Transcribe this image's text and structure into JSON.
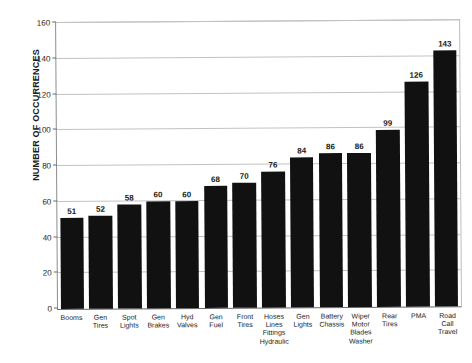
{
  "chart_data": {
    "type": "bar",
    "title": "",
    "xlabel": "",
    "ylabel": "NUMBER OF OCCURRENCES",
    "ylim": [
      0,
      160
    ],
    "ytick_step": 20,
    "yticks": [
      "0",
      "20",
      "40",
      "60",
      "80",
      "100",
      "120",
      "140",
      "160"
    ],
    "grid": true,
    "legend": "none",
    "bar_color": "#111111",
    "gridline_color": "#c2c2c2",
    "axis_color": "#6a6a6a",
    "categories": [
      "Booms",
      "Gen Tires",
      "Spot Lights",
      "Gen Brakes",
      "Hyd Valves",
      "Gen Fuel",
      "Front Tires",
      "Hoses Lines Fittings Hydraulic",
      "Gen Lights",
      "Battery Chassis",
      "Wiper Motor Blades Washer",
      "Rear Tires",
      "PMA",
      "Road Call Travel"
    ],
    "category_lines": [
      [
        "Booms"
      ],
      [
        "Gen",
        "Tires"
      ],
      [
        "Spot",
        "Lights"
      ],
      [
        "Gen",
        "Brakes"
      ],
      [
        "Hyd",
        "Valves"
      ],
      [
        "Gen",
        "Fuel"
      ],
      [
        "Front",
        "Tires"
      ],
      [
        "Hoses",
        "Lines",
        "Fittings",
        "Hydraulic"
      ],
      [
        "Gen",
        "Lights"
      ],
      [
        "Battery",
        "Chassis"
      ],
      [
        "Wiper",
        "Motor",
        "Blades",
        "Washer"
      ],
      [
        "Rear",
        "Tires"
      ],
      [
        "PMA"
      ],
      [
        "Road",
        "Call",
        "Travel"
      ]
    ],
    "values": [
      51,
      52,
      58,
      60,
      60,
      68,
      70,
      76,
      84,
      86,
      86,
      99,
      126,
      143
    ],
    "value_labels": [
      "51",
      "52",
      "58",
      "60",
      "60",
      "68",
      "70",
      "76",
      "84",
      "86",
      "86",
      "99",
      "126",
      "143"
    ]
  }
}
